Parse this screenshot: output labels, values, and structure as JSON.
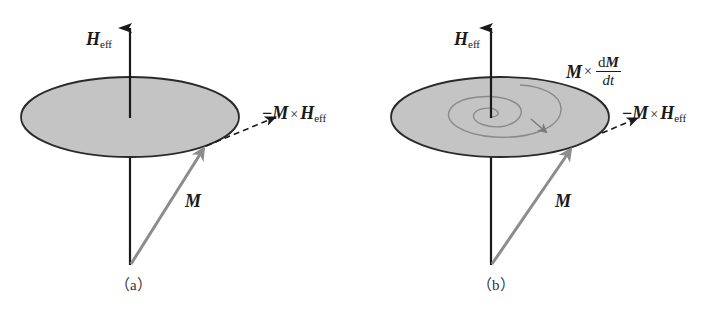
{
  "figure": {
    "colors": {
      "disk_fill": "#c4c4c4",
      "disk_stroke": "#2a2a2a",
      "axis": "#1a1a1a",
      "m_vector": "#8c8c8c",
      "spiral": "#8a8a8a",
      "background": "#ffffff"
    },
    "panels": [
      {
        "id": "a",
        "caption": "（a）",
        "labels": {
          "field": {
            "symbol": "H",
            "subscript": "eff"
          },
          "magnetization": "M",
          "precession_torque": {
            "minus": "−",
            "m": "M",
            "cross": "×",
            "h": "H",
            "subscript": "eff"
          }
        },
        "has_damping_spiral": false
      },
      {
        "id": "b",
        "caption": "（b）",
        "labels": {
          "field": {
            "symbol": "H",
            "subscript": "eff"
          },
          "magnetization": "M",
          "precession_torque": {
            "minus": "−",
            "m": "M",
            "cross": "×",
            "h": "H",
            "subscript": "eff"
          },
          "damping_torque": {
            "m": "M",
            "cross": "×",
            "numerator_d": "d",
            "numerator_m": "M",
            "denominator": "dt"
          }
        },
        "has_damping_spiral": true
      }
    ]
  }
}
